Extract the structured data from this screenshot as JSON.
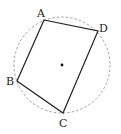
{
  "diagram": {
    "type": "cyclic-quadrilateral",
    "circle": {
      "cx": 62,
      "cy": 65,
      "r": 48,
      "stroke": "#888888",
      "dashed": true
    },
    "center_dot": {
      "x": 62,
      "y": 65
    },
    "vertices": [
      {
        "name": "A",
        "x": 44,
        "y": 20,
        "label_x": 37,
        "label_y": 17
      },
      {
        "name": "D",
        "x": 98,
        "y": 31,
        "label_x": 99,
        "label_y": 32
      },
      {
        "name": "C",
        "x": 63,
        "y": 113,
        "label_x": 59,
        "label_y": 127
      },
      {
        "name": "B",
        "x": 17,
        "y": 81,
        "label_x": 6,
        "label_y": 85
      }
    ],
    "edges": [
      [
        "A",
        "D"
      ],
      [
        "D",
        "C"
      ],
      [
        "C",
        "B"
      ],
      [
        "B",
        "A"
      ]
    ],
    "line_color": "#222222"
  }
}
